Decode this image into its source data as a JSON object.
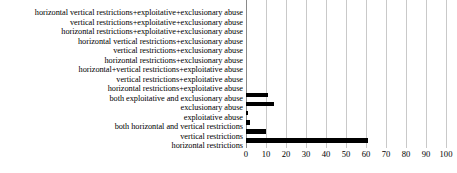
{
  "chart_data": {
    "type": "bar",
    "orientation": "horizontal",
    "title": "",
    "xlabel": "",
    "ylabel": "",
    "xlim": [
      0,
      100
    ],
    "xticks": [
      0,
      10,
      20,
      30,
      40,
      50,
      60,
      70,
      80,
      90,
      100
    ],
    "grid": true,
    "legend": false,
    "bar_color": "#000000",
    "gridline_color": "#c9c9c9",
    "categories": [
      "horizontal vertical restrictions+exploitative+exclusionary abuse",
      "vertical restrictions+exploitative+exclusionary abuse",
      "horizontal restrictions+exploitative+exclusionary abuse",
      "horizontal vertical restrictions+exclusionary abuse",
      "vertical restrictions+exclusionary abuse",
      "horizontal restrictions+exclusionary abuse",
      "horizontal+vertical restrictions+exploitative abuse",
      "vertical restrictions+exploitative abuse",
      "horizontal restrictions+exploitative abuse",
      "both exploitative and exclusionary abuse",
      "exclusionary abuse",
      "exploitative abuse",
      "both horizontal and vertical restrictions",
      "vertical restrictions",
      "horizontal restrictions"
    ],
    "values": [
      0,
      0,
      0,
      0,
      0,
      0,
      0,
      0,
      0,
      11,
      14,
      1,
      2,
      10,
      61
    ]
  }
}
